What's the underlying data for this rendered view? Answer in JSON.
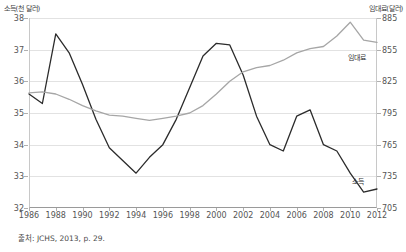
{
  "chart_data": {
    "type": "line",
    "title": "",
    "source_note": "출처: JCHS, 2013, p. 29.",
    "xlabel": "",
    "grid": true,
    "legend_position": "inline-right",
    "x": [
      1986,
      1987,
      1988,
      1989,
      1990,
      1991,
      1992,
      1993,
      1994,
      1995,
      1996,
      1997,
      1998,
      1999,
      2000,
      2001,
      2002,
      2003,
      2004,
      2005,
      2006,
      2007,
      2008,
      2009,
      2010,
      2011,
      2012
    ],
    "x_tick_labels": [
      "1986",
      "1988",
      "1990",
      "1992",
      "1994",
      "1996",
      "1998",
      "2000",
      "2002",
      "2004",
      "2006",
      "2008",
      "2010",
      "2012"
    ],
    "x_tick_values": [
      1986,
      1988,
      1990,
      1992,
      1994,
      1996,
      1998,
      2000,
      2002,
      2004,
      2006,
      2008,
      2010,
      2012
    ],
    "xlim": [
      1986,
      2012
    ],
    "axes": {
      "left": {
        "title": "소득(천 달러)",
        "ylim": [
          32,
          38
        ],
        "ticks": [
          32,
          33,
          34,
          35,
          36,
          37,
          38
        ],
        "tick_labels": [
          "32",
          "33",
          "34",
          "35",
          "36",
          "37",
          "38"
        ]
      },
      "right": {
        "title": "임대료(달러)",
        "ylim": [
          705,
          885
        ],
        "ticks": [
          705,
          735,
          765,
          795,
          825,
          855,
          885
        ],
        "tick_labels": [
          "705",
          "735",
          "765",
          "795",
          "825",
          "855",
          "885"
        ]
      }
    },
    "series": [
      {
        "name": "소득",
        "label": "소득",
        "axis": "left",
        "color": "#2b2b2b",
        "values": [
          35.6,
          35.3,
          37.5,
          36.9,
          35.9,
          34.8,
          33.9,
          33.5,
          33.1,
          33.6,
          34.0,
          34.8,
          35.8,
          36.8,
          37.2,
          37.15,
          36.2,
          34.9,
          34.0,
          33.8,
          34.9,
          35.1,
          34.0,
          33.8,
          33.1,
          32.5,
          32.6
        ]
      },
      {
        "name": "임대료",
        "label": "임대료",
        "axis": "right",
        "color": "#a6a6a6",
        "values": [
          814,
          815,
          813,
          808,
          802,
          797,
          793,
          792,
          790,
          788,
          790,
          792,
          795,
          802,
          813,
          825,
          834,
          838,
          840,
          845,
          852,
          856,
          858,
          868,
          881,
          864,
          862
        ]
      }
    ]
  }
}
